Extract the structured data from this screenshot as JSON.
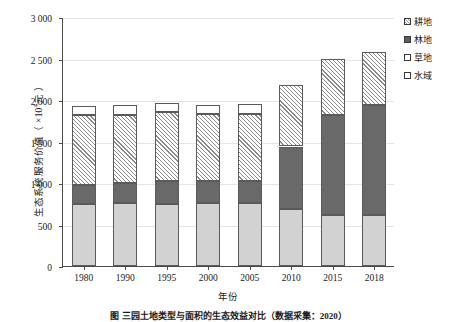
{
  "chart_data": {
    "type": "bar",
    "stacked": true,
    "title": "",
    "xlabel": "年份",
    "ylabel": "生态系统服务价值（ ×10⁴元 ）",
    "ylabel_main": "生态系统服务价值（ ×10",
    "ylabel_exp": "4",
    "ylabel_tail": "元 ）",
    "ylim": [
      0,
      3000
    ],
    "ytick_step": 500,
    "grid": true,
    "legend_position": "right-top",
    "categories": [
      "1980",
      "1990",
      "1995",
      "2000",
      "2005",
      "2010",
      "2015",
      "2018"
    ],
    "ytick_labels": [
      "0",
      "500",
      "1 000",
      "1 500",
      "2 000",
      "2 500",
      "3 000"
    ],
    "ytick_values": [
      0,
      500,
      1000,
      1500,
      2000,
      2500,
      3000
    ],
    "series": [
      {
        "name": "水域",
        "fill": "light-gray",
        "color": "#d2d2d2",
        "values": [
          745,
          755,
          745,
          765,
          765,
          685,
          620,
          615
        ]
      },
      {
        "name": "林地",
        "fill": "dark-gray",
        "color": "#696969",
        "values": [
          235,
          250,
          285,
          260,
          265,
          755,
          1200,
          1325
        ]
      },
      {
        "name": "耕地",
        "fill": "diagonal-hatch",
        "color": "#ffffff",
        "values": [
          840,
          815,
          820,
          810,
          805,
          740,
          675,
          635
        ]
      },
      {
        "name": "草地",
        "fill": "white",
        "color": "#ffffff",
        "values": [
          110,
          115,
          115,
          110,
          115,
          0,
          0,
          0
        ]
      }
    ],
    "totals": [
      1930,
      1935,
      1965,
      1945,
      1950,
      2180,
      2495,
      2575
    ],
    "legend_order": [
      "耕地",
      "林地",
      "草地",
      "水域"
    ]
  },
  "legend": {
    "items": [
      {
        "label": "耕地",
        "swatch": "farm-hatch-swatch"
      },
      {
        "label": "林地",
        "swatch": "forest-dark-swatch"
      },
      {
        "label": "草地",
        "swatch": "grass-white-swatch"
      },
      {
        "label": "水域",
        "swatch": "water-white-swatch"
      }
    ]
  },
  "caption": {
    "text": "图       三园土地类型与面积的生态效益对比（数据采集：2020）"
  },
  "colors": {
    "axis": "#4a4a4a",
    "grid": "#e4e4e4",
    "water": "#d2d2d2",
    "forest": "#696969",
    "farm": "#ffffff",
    "grass": "#ffffff",
    "text": "#1a1a1a"
  }
}
